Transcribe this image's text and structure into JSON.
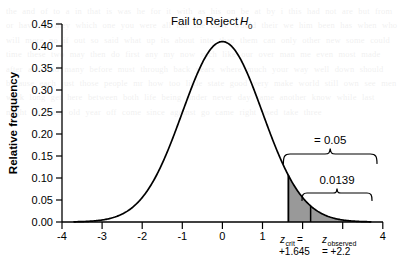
{
  "figure": {
    "background_color": "#ffffff",
    "curve_color": "#000000",
    "fill_color": "#999999",
    "axis_color": "#000000"
  },
  "annotations": {
    "fail_to_reject": "Fail to Reject",
    "h_symbol": "H",
    "h_subscript": "0",
    "alpha_label": "= 0.05",
    "p_label": "0.0139",
    "zcrit_symbol": "z",
    "zcrit_subscript": "crit",
    "zcrit_eq": "=",
    "zcrit_value": "+1.645",
    "zobs_symbol": "z",
    "zobs_subscript": "observed",
    "zobs_value": "= +2.2"
  },
  "watermark": {
    "text": "the and of to a in that is was he for it with as his on be at by i this had not are but from or have an they which one you were all her she there would their we him been has when who will more no if out so said what up its about into than them can only other new some could time these two may then do first any my now such like our over man me even most made after also did many before must through back years where much your way well down should because each just those people mr how too little state good very make world still own see men work long get here between both life being under never day same another know while last might us great old year off come since against go came right used take three"
  },
  "chart_data": {
    "type": "line",
    "title": "",
    "xlabel": "",
    "ylabel": "Relative frequency",
    "xlim": [
      -4,
      4
    ],
    "ylim": [
      0.0,
      0.45
    ],
    "grid": false,
    "legend": "none",
    "x_ticks": [
      -4,
      -3,
      -2,
      -1,
      0,
      1,
      2,
      3,
      4
    ],
    "x_tick_labels": [
      "-4",
      "-3",
      "-2",
      "-1",
      "0",
      "1",
      "",
      "",
      "4"
    ],
    "y_ticks": [
      0.0,
      0.05,
      0.1,
      0.15,
      0.2,
      0.25,
      0.3,
      0.35,
      0.4,
      0.45
    ],
    "y_tick_labels": [
      "0.00",
      "0.05",
      "0.10",
      "0.15",
      "0.20",
      "0.25",
      "0.30",
      "0.35",
      "0.40",
      "0.45"
    ],
    "series": [
      {
        "name": "standard normal density",
        "distribution": "normal",
        "mean": 0,
        "sd": 1,
        "peak_value": 0.41
      }
    ],
    "shaded_regions": [
      {
        "name": "alpha-region",
        "from": 1.645,
        "to": 2.2,
        "area": 0.05,
        "color": "#999999"
      },
      {
        "name": "p-value-region",
        "from": 2.2,
        "to": 3.7,
        "area": 0.0139,
        "color": "#999999"
      }
    ],
    "markers": [
      {
        "name": "z-critical",
        "x": 1.645,
        "label": "+1.645"
      },
      {
        "name": "z-observed",
        "x": 2.2,
        "label": "+2.2"
      }
    ],
    "braces": [
      {
        "name": "alpha-brace",
        "from": 1.645,
        "to": 3.7,
        "label": "= 0.05"
      },
      {
        "name": "p-brace",
        "from": 2.2,
        "to": 3.7,
        "label": "0.0139"
      }
    ]
  }
}
